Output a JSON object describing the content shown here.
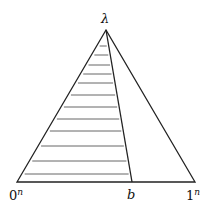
{
  "diagram": {
    "labels": {
      "apex": "λ",
      "left": "0",
      "left_sup": "n",
      "middle": "b",
      "right": "1",
      "right_sup": "n"
    },
    "geometry": {
      "apex": [
        106,
        30
      ],
      "base_left": [
        17,
        182
      ],
      "base_right": [
        195,
        182
      ],
      "b_point": [
        132,
        182
      ]
    },
    "hatch_lines_y": [
      46,
      55,
      65,
      74,
      83,
      95,
      107,
      119,
      131,
      146,
      161,
      174
    ],
    "colors": {
      "stroke": "#222222",
      "hatch": "#555555"
    }
  }
}
